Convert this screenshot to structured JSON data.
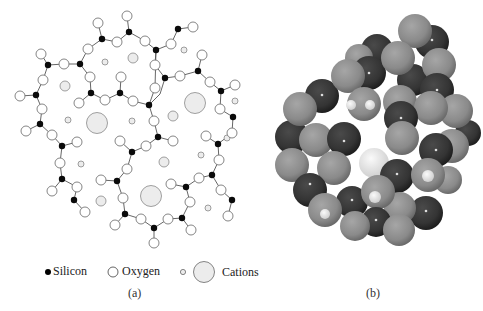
{
  "figure": {
    "panels": [
      {
        "id": "a",
        "caption": "(a)",
        "description": "2D schematic of silicate glass network: silicon atoms bonded to oxygen atoms in irregular rings, with cations in the voids"
      },
      {
        "id": "b",
        "caption": "(b)",
        "description": "3D space-filling model of silicate glass cluster"
      }
    ],
    "legend": {
      "items": [
        {
          "label": "Silicon",
          "symbol": "filled-small-circle",
          "color": "#000000"
        },
        {
          "label": "Oxygen",
          "symbol": "open-circle",
          "color": "#ffffff"
        },
        {
          "label": "Cations",
          "symbol": "small-and-large-gray-circles",
          "color": "#ececec"
        }
      ]
    },
    "colors": {
      "silicon": "#0a0a0a",
      "oxygen_fill": "#ffffff",
      "oxygen_stroke": "#777777",
      "cation_fill": "#ececec",
      "bond": "#555555",
      "sphere_light": "#8c8c8c",
      "sphere_dark": "#3a3a3a",
      "sphere_white": "#e8e8e8"
    }
  }
}
